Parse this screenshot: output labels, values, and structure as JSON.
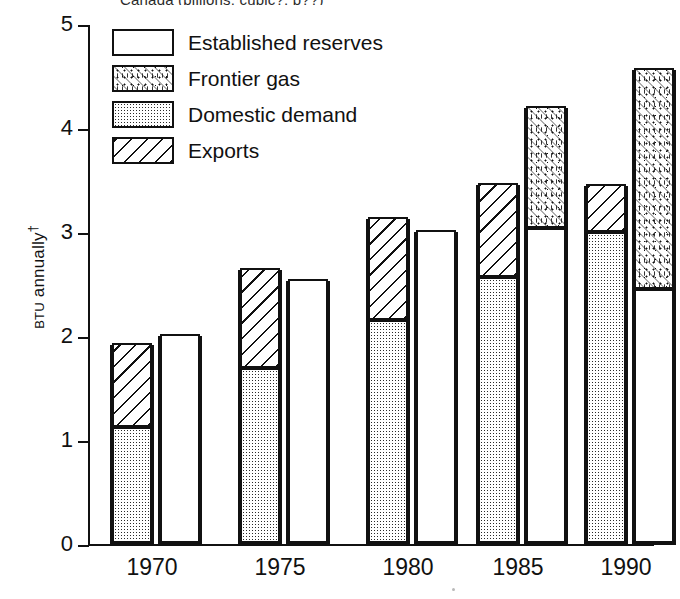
{
  "title": "Canada (billions, cubic?, p??)",
  "axes": {
    "y_label_small": "BTU",
    "y_label_rest": " annually",
    "y_label_marker": "†",
    "y_ticks": [
      "5",
      "4",
      "3",
      "2",
      "1",
      "0"
    ],
    "x_ticks": [
      "1970",
      "1975",
      "1980",
      "1985",
      "1990"
    ]
  },
  "legend": {
    "items": [
      {
        "label": "Established reserves",
        "pattern": "pat-empty",
        "name": "legend-swatch-established-reserves"
      },
      {
        "label": "Frontier gas",
        "pattern": "pat-speckle",
        "name": "legend-swatch-frontier-gas"
      },
      {
        "label": "Domestic demand",
        "pattern": "pat-dots",
        "name": "legend-swatch-domestic-demand"
      },
      {
        "label": "Exports",
        "pattern": "pat-hatch",
        "name": "legend-swatch-exports"
      }
    ]
  },
  "chart_data": {
    "type": "bar",
    "title": "Canada (billions, cubic?, p??)",
    "xlabel": "",
    "ylabel": "BTU annually†",
    "ylim": [
      0,
      5
    ],
    "ytick_values": [
      0,
      1,
      2,
      3,
      4,
      5
    ],
    "grid": false,
    "legend_position": "top-left inside plot",
    "categories": [
      "1970",
      "1975",
      "1980",
      "1985",
      "1990"
    ],
    "group_note": "Each year shows two adjacent stacked bars: left = demand side (Domestic demand bottom + Exports top), right = supply side (Established reserves bottom + Frontier gas top).",
    "series": [
      {
        "name": "Domestic demand",
        "stack": "demand",
        "values": [
          1.12,
          1.68,
          2.14,
          2.56,
          2.99
        ]
      },
      {
        "name": "Exports",
        "stack": "demand",
        "values": [
          0.8,
          0.96,
          0.99,
          0.9,
          0.46
        ]
      },
      {
        "name": "Established reserves",
        "stack": "supply",
        "values": [
          2.01,
          2.54,
          3.01,
          3.03,
          2.44
        ]
      },
      {
        "name": "Frontier gas",
        "stack": "supply",
        "values": [
          0.0,
          0.0,
          0.0,
          1.17,
          2.13
        ]
      }
    ],
    "stack_totals": {
      "demand": [
        1.92,
        2.64,
        3.13,
        3.46,
        3.45
      ],
      "supply": [
        2.01,
        2.54,
        3.01,
        4.2,
        4.57
      ]
    }
  },
  "geometry": {
    "y_zero_px": 545,
    "px_per_unit": 104,
    "bar_width_px": 44,
    "group_left_px": [
      110,
      238,
      366,
      494
    ],
    "groups": [
      {
        "year": "1970",
        "demand_x": 110,
        "supply_x": 158,
        "label_center": 152
      },
      {
        "year": "1975",
        "demand_x": 238,
        "supply_x": 286,
        "label_center": 280
      },
      {
        "year": "1980",
        "demand_x": 366,
        "supply_x": 414,
        "label_center": 408
      },
      {
        "year": "1985",
        "demand_x": 476,
        "supply_x": 524,
        "label_center": 518
      },
      {
        "year": "1990",
        "demand_x": 584,
        "supply_x": 632,
        "label_center": 626
      }
    ]
  }
}
